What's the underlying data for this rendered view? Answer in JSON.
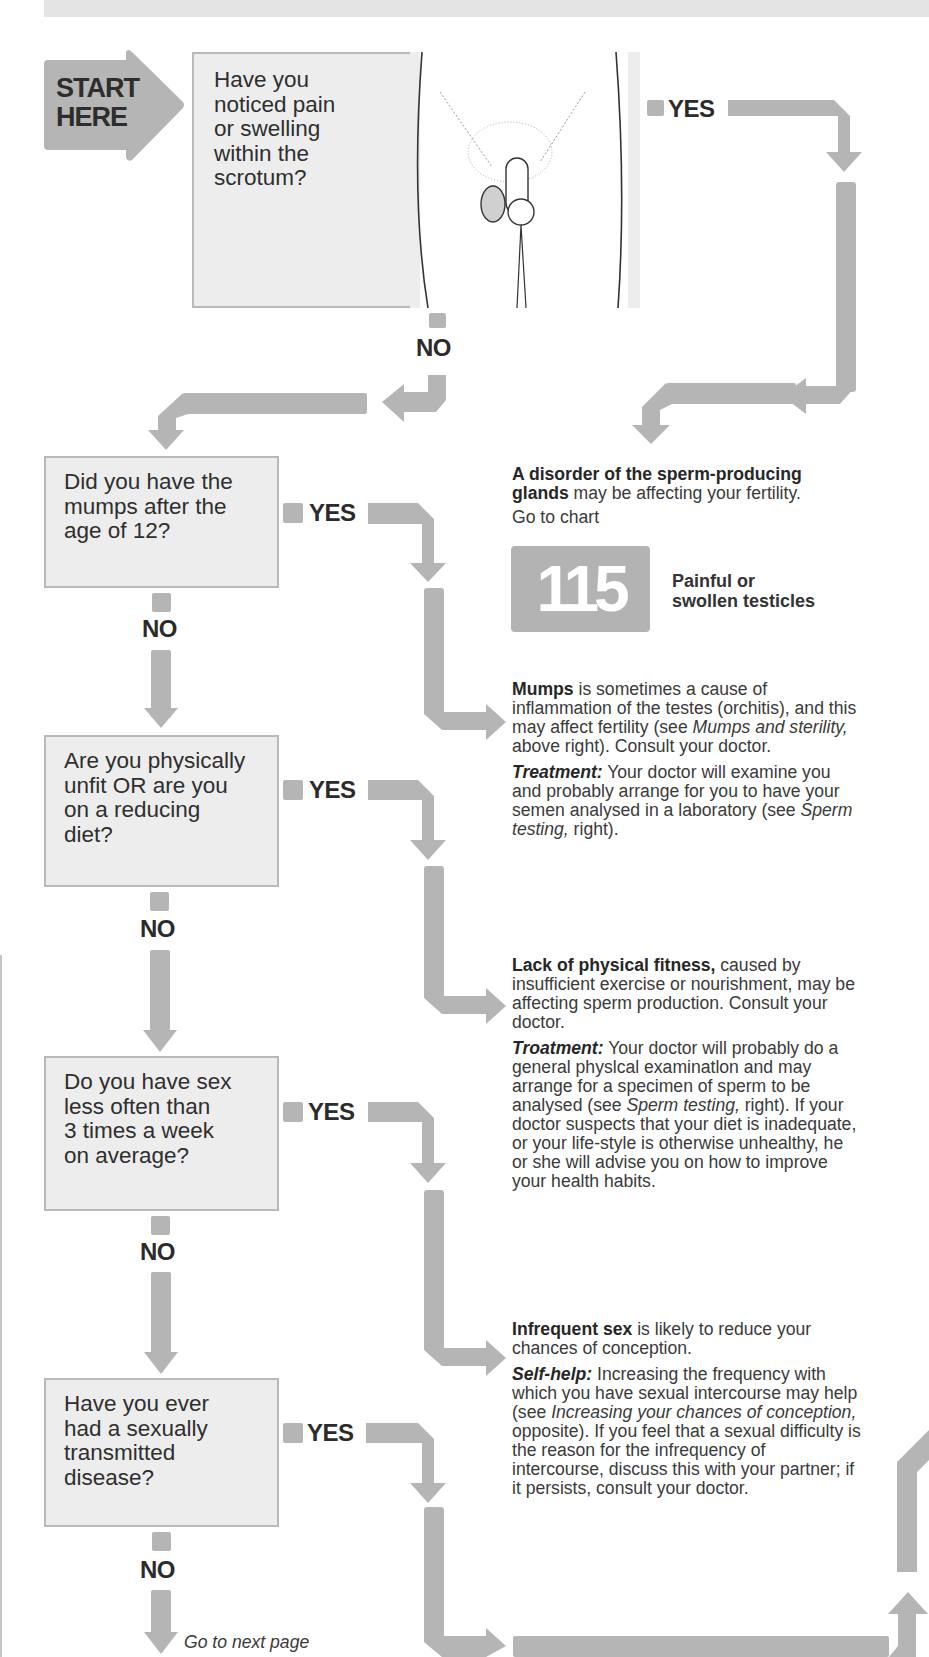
{
  "colors": {
    "arrow": "#b5b5b5",
    "box_fill": "#ededed",
    "box_border": "#b9b9b9",
    "text": "#2e2e2e",
    "badge": "#b3b3b3"
  },
  "start": {
    "line1": "START",
    "line2": "HERE"
  },
  "questions": [
    {
      "lines": [
        "Have you",
        "noticed pain",
        "or swelling",
        "within the",
        "scrotum?"
      ],
      "yes": "YES",
      "no": "NO"
    },
    {
      "lines": [
        "Did you have the",
        "mumps after the",
        "age of 12?"
      ],
      "yes": "YES",
      "no": "NO"
    },
    {
      "lines": [
        "Are you physically",
        "unfit OR are you",
        "on a reducing",
        "diet?"
      ],
      "yes": "YES",
      "no": "NO"
    },
    {
      "lines": [
        "Do you have sex",
        "less often than",
        "3 times a week",
        "on average?"
      ],
      "yes": "YES",
      "no": "NO"
    },
    {
      "lines": [
        "Have you ever",
        "had a sexually",
        "transmitted",
        "disease?"
      ],
      "yes": "YES",
      "no": "NO"
    }
  ],
  "results": {
    "disorder": {
      "bold": "A disorder of the sperm-producing glands",
      "text": " may be affecting your fertility.",
      "goto": "Go to chart",
      "chart_number": "115",
      "chart_title_1": "Painful or",
      "chart_title_2": "swollen testicles"
    },
    "mumps": {
      "bold": "Mumps",
      "text": " is sometimes a cause of inflammation of the testes (orchitis), and this may affect fertility (see ",
      "ref": "Mumps and sterility,",
      "text2": " above right). Consult your doctor.",
      "t_label": "Treatment:",
      "t_text": " Your doctor will examine you and probably arrange for you to have your semen analysed in a laboratory (see ",
      "t_ref": "Sperm testing,",
      "t_text2": " right)."
    },
    "fitness": {
      "bold": "Lack of physical fitness,",
      "text": " caused by insufficient exercise or nourishment, may be affecting sperm production. Consult your doctor.",
      "t_label": "Troatment:",
      "t_text": " Your doctor will probably do a general physlcal examinatlon and may arrange for a specimen of sperm to be analysed (see ",
      "t_ref": "Sperm testing,",
      "t_text2": " right). If your doctor suspects that your diet is inadequate, or your life-style is otherwise unhealthy, he or she will advise you on how to improve your health habits."
    },
    "infrequent": {
      "bold": "Infrequent sex",
      "text": " is likely to reduce your chances of conception.",
      "s_label": "Self-help:",
      "s_text": " Increasing the frequency with which you have sexual intercourse may help (see ",
      "s_ref": "Increasing your chances of conception,",
      "s_text2": " opposite). If you feel that a sexual difficulty is the reason for the infrequency of intercourse, discuss this with your partner; if it persists, consult your doctor."
    }
  },
  "footer": {
    "next": "Go to next page"
  }
}
